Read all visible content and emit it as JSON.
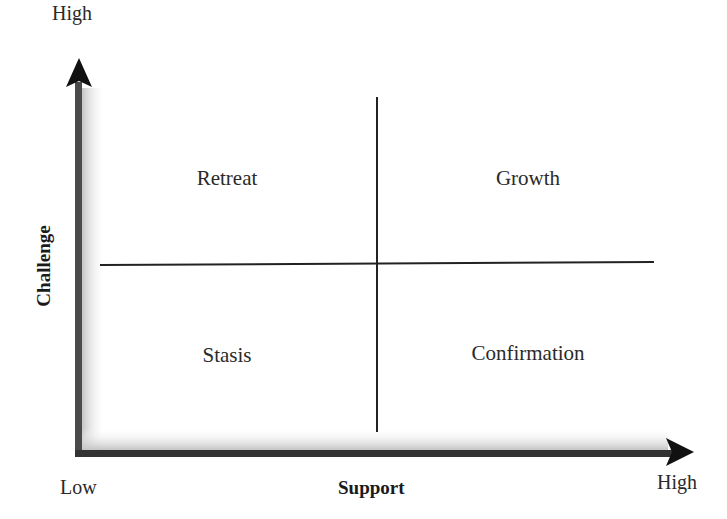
{
  "diagram": {
    "type": "2x2-matrix",
    "x_axis": {
      "label": "Support",
      "low": "Low",
      "high": "High"
    },
    "y_axis": {
      "label": "Challenge",
      "high": "High"
    },
    "quadrants": [
      {
        "position": "top-left",
        "label": "Retreat"
      },
      {
        "position": "top-right",
        "label": "Growth"
      },
      {
        "position": "bottom-left",
        "label": "Stasis"
      },
      {
        "position": "bottom-right",
        "label": "Confirmation"
      }
    ],
    "colors": {
      "axis": "#111111",
      "divider": "#222222",
      "shade": "#c8c8c8"
    }
  }
}
